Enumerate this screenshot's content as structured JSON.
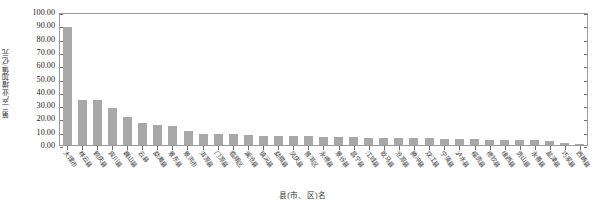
{
  "chart_data": {
    "type": "bar",
    "title": "",
    "subtitle": "",
    "xlabel": "县(市、区)名",
    "ylabel": "第二产业增加值/亿元",
    "ylim": [
      0,
      100
    ],
    "ytick_step": 10,
    "ytick_labels": [
      "100.00",
      "90.00",
      "80.00",
      "70.00",
      "60.00",
      "50.00",
      "40.00",
      "30.00",
      "20.00",
      "10.00",
      "0.00"
    ],
    "ytick_values": [
      100,
      90,
      80,
      70,
      60,
      50,
      40,
      30,
      20,
      10,
      0
    ],
    "grid": false,
    "legend": null,
    "bar_color": "#a8a8a8",
    "axis_color": "#9a9a9a",
    "categories": [
      "大理市",
      "祥云县",
      "鹤庆县",
      "宾川县",
      "巍山县",
      "云县",
      "勐海县",
      "景东县",
      "景洪市",
      "洱源县",
      "门源县",
      "临翔区",
      "澜沧县",
      "镇沅县",
      "勐腊县",
      "凤庆县",
      "普洱区",
      "永德县",
      "景谷县",
      "昌宁县",
      "江城县",
      "耿马县",
      "沧源县",
      "腾冲县",
      "双江县",
      "宁蒗县",
      "泸水县",
      "福贡县",
      "德钦县",
      "维西县",
      "贡山县",
      "永善县",
      "盐津县",
      "巧家县",
      "西畴县"
    ],
    "values": [
      89.0,
      33.5,
      33.5,
      28.0,
      21.0,
      16.5,
      15.0,
      14.0,
      10.5,
      8.5,
      8.0,
      8.0,
      7.5,
      7.0,
      7.0,
      6.5,
      6.5,
      6.0,
      6.0,
      6.0,
      5.5,
      5.5,
      5.0,
      5.0,
      5.0,
      4.5,
      4.5,
      4.5,
      4.0,
      4.0,
      3.5,
      3.5,
      3.0,
      1.5,
      1.0
    ]
  }
}
